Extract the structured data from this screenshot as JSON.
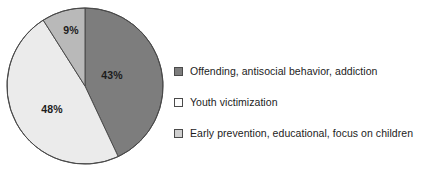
{
  "chart_data": {
    "type": "pie",
    "title": "",
    "subtitle": "",
    "xlabel": "",
    "ylabel": "",
    "grid": false,
    "legend_position": "right",
    "start_angle_deg": 0,
    "direction": "clockwise",
    "center": {
      "x": 85,
      "y": 86
    },
    "radius": 78,
    "categories": [
      "Offending, antisocial behavior, addiction",
      "Youth victimization",
      "Early prevention, educational, focus on children"
    ],
    "values": [
      43,
      48,
      9
    ],
    "value_labels": [
      "43%",
      "48%",
      "9%"
    ],
    "colors": [
      "#7d7d7d",
      "#ebebeb",
      "#b9b9b9"
    ],
    "slice_border_color": "#4a4a4a",
    "slices": [
      {
        "label": "Offending, antisocial behavior, addiction",
        "value": 43,
        "value_label": "43%",
        "color": "#7d7d7d",
        "start_deg": 0,
        "end_deg": 154.8,
        "label_x": 112,
        "label_y": 75
      },
      {
        "label": "Youth victimization",
        "value": 48,
        "value_label": "48%",
        "color": "#ebebeb",
        "start_deg": 154.8,
        "end_deg": 327.6,
        "label_x": 52,
        "label_y": 109
      },
      {
        "label": "Early prevention, educational, focus on children",
        "value": 9,
        "value_label": "9%",
        "color": "#b9b9b9",
        "start_deg": 327.6,
        "end_deg": 360,
        "label_x": 71,
        "label_y": 30
      }
    ]
  },
  "legend": {
    "items": [
      {
        "label": "Offending, antisocial behavior, addiction",
        "swatch_color": "#7d7d7d"
      },
      {
        "label": "Youth victimization",
        "swatch_color": "#fcfcfc"
      },
      {
        "label": "Early prevention, educational, focus on children",
        "swatch_color": "#cfcfcf"
      }
    ]
  }
}
